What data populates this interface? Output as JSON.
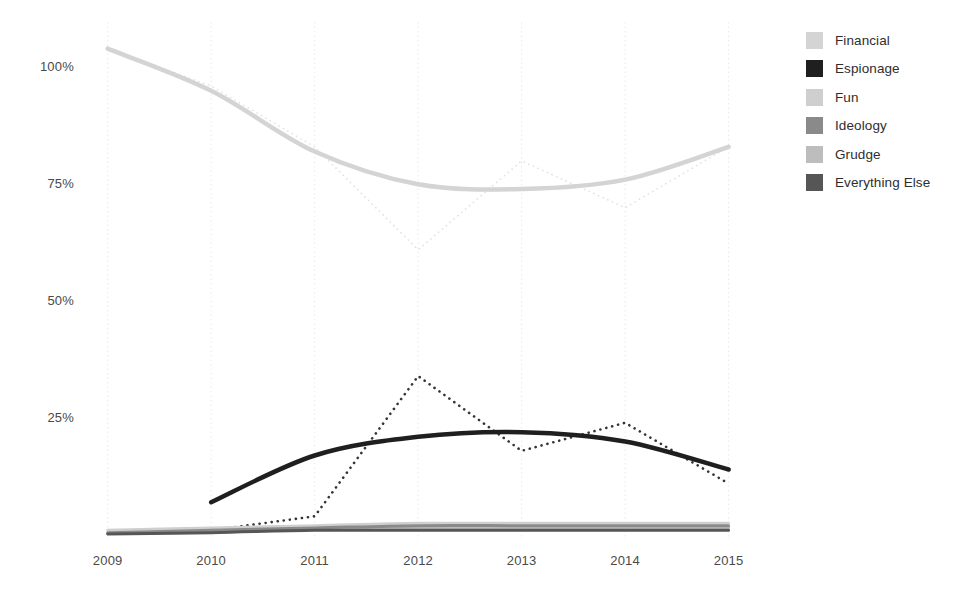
{
  "chart_data": {
    "type": "line",
    "title": "",
    "subtitle": "",
    "xlabel": "",
    "ylabel": "",
    "x": [
      2009,
      2010,
      2011,
      2012,
      2013,
      2014,
      2015
    ],
    "categories": [
      "2009",
      "2010",
      "2011",
      "2012",
      "2013",
      "2014",
      "2015"
    ],
    "ytick_labels": [
      "100%",
      "75%",
      "50%",
      "25%"
    ],
    "ytick_values": [
      100,
      75,
      50,
      25
    ],
    "ylim": [
      0,
      108
    ],
    "xlim": [
      2008.8,
      2015.4
    ],
    "grid": "dotted-vertical-at-each-year",
    "legend_position": "right",
    "value_format": "percent",
    "series": [
      {
        "name": "Financial",
        "color": "#d4d4d4",
        "style": "smooth-trend",
        "values": [
          104,
          95,
          82,
          75,
          74,
          76,
          83
        ],
        "raw_style": "dotted",
        "raw_values": [
          104,
          96,
          83,
          61,
          80,
          70,
          83
        ]
      },
      {
        "name": "Espionage",
        "color": "#1f1f1f",
        "style": "smooth-trend",
        "values": [
          null,
          7,
          17,
          21,
          22,
          20,
          14
        ],
        "raw_style": "dotted",
        "raw_values": [
          null,
          1,
          4,
          34,
          18,
          24,
          11
        ]
      },
      {
        "name": "Fun",
        "color": "#cfcfcf",
        "style": "smooth-trend",
        "values": [
          1,
          1.5,
          2,
          2.5,
          2.5,
          2.5,
          2.5
        ]
      },
      {
        "name": "Ideology",
        "color": "#8a8a8a",
        "style": "smooth-trend",
        "values": [
          0.5,
          1,
          1.5,
          2,
          2,
          2,
          2
        ]
      },
      {
        "name": "Grudge",
        "color": "#bdbdbd",
        "style": "smooth-trend",
        "values": [
          0.3,
          0.8,
          1.2,
          1.5,
          1.5,
          1.5,
          1.5
        ]
      },
      {
        "name": "Everything Else",
        "color": "#565656",
        "style": "smooth-trend",
        "values": [
          0.2,
          0.5,
          1,
          1,
          1,
          1,
          1
        ]
      }
    ]
  },
  "axes": {
    "y_ticks": [
      {
        "label": "100%",
        "value": 100
      },
      {
        "label": "75%",
        "value": 75
      },
      {
        "label": "50%",
        "value": 50
      },
      {
        "label": "25%",
        "value": 25
      }
    ],
    "x_ticks": [
      {
        "label": "2009",
        "value": 2009
      },
      {
        "label": "2010",
        "value": 2010
      },
      {
        "label": "2011",
        "value": 2011
      },
      {
        "label": "2012",
        "value": 2012
      },
      {
        "label": "2013",
        "value": 2013
      },
      {
        "label": "2014",
        "value": 2014
      },
      {
        "label": "2015",
        "value": 2015
      }
    ]
  },
  "legend": {
    "items": [
      {
        "label": "Financial",
        "color": "#d4d4d4"
      },
      {
        "label": "Espionage",
        "color": "#1f1f1f"
      },
      {
        "label": "Fun",
        "color": "#cfcfcf"
      },
      {
        "label": "Ideology",
        "color": "#8a8a8a"
      },
      {
        "label": "Grudge",
        "color": "#bdbdbd"
      },
      {
        "label": "Everything Else",
        "color": "#565656"
      }
    ]
  }
}
